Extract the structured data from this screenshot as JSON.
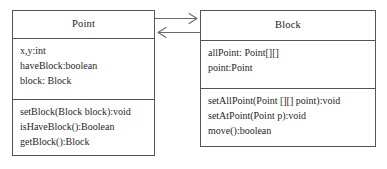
{
  "diagram": {
    "background_color": "#ffffff",
    "line_color": "#555555",
    "text_color": "#1f1f1f"
  },
  "classes": [
    {
      "id": "point",
      "name": "Point",
      "attributes": [
        "x,y:int",
        "haveBlock:boolean",
        "block: Block"
      ],
      "operations": [
        "setBlock(Block block):void",
        "isHaveBlock():Boolean",
        "getBlock():Block"
      ]
    },
    {
      "id": "block",
      "name": "Block",
      "attributes": [
        "allPoint: Point[][]",
        "point:Point"
      ],
      "operations": [
        "setAllPoint(Point [][] point):void",
        "setAtPoint(Point p):void",
        "move():boolean"
      ]
    }
  ],
  "connectors": [
    {
      "id": "point-to-block",
      "from": "Point",
      "to": "Block",
      "direction": "right",
      "arrowhead": "open-arrow",
      "label": ""
    },
    {
      "id": "block-to-point",
      "from": "Block",
      "to": "Point",
      "direction": "left",
      "arrowhead": "open-arrow",
      "label": ""
    }
  ]
}
